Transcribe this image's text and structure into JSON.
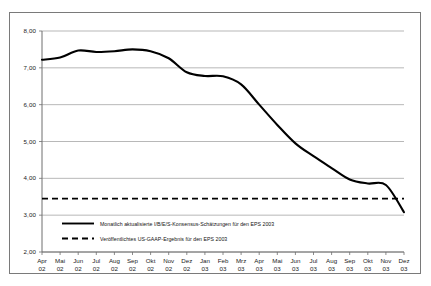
{
  "chart_data": {
    "type": "line",
    "title": "",
    "subtitle": "",
    "xlabel": "",
    "ylabel": "",
    "ylim": [
      2.0,
      8.0
    ],
    "ytick_step": 1.0,
    "grid": true,
    "legend_position": "inside-bottom-left",
    "decimal_separator": "comma",
    "x_tick_labels": [
      {
        "month": "Apr",
        "year": "02"
      },
      {
        "month": "Mai",
        "year": "02"
      },
      {
        "month": "Jun",
        "year": "02"
      },
      {
        "month": "Jul",
        "year": "02"
      },
      {
        "month": "Aug",
        "year": "02"
      },
      {
        "month": "Sep",
        "year": "02"
      },
      {
        "month": "Okt",
        "year": "02"
      },
      {
        "month": "Nov",
        "year": "02"
      },
      {
        "month": "Dez",
        "year": "02"
      },
      {
        "month": "Jan",
        "year": "03"
      },
      {
        "month": "Feb",
        "year": "03"
      },
      {
        "month": "Mrz",
        "year": "03"
      },
      {
        "month": "Apr",
        "year": "03"
      },
      {
        "month": "Mai",
        "year": "03"
      },
      {
        "month": "Jun",
        "year": "03"
      },
      {
        "month": "Jul",
        "year": "03"
      },
      {
        "month": "Aug",
        "year": "03"
      },
      {
        "month": "Sep",
        "year": "03"
      },
      {
        "month": "Okt",
        "year": "03"
      },
      {
        "month": "Nov",
        "year": "03"
      },
      {
        "month": "Dez",
        "year": "03"
      }
    ],
    "y_tick_labels": [
      "8,00",
      "7,00",
      "6,00",
      "5,00",
      "4,00",
      "3,00",
      "2,00"
    ],
    "categories": [
      "Apr 02",
      "Mai 02",
      "Jun 02",
      "Jul 02",
      "Aug 02",
      "Sep 02",
      "Okt 02",
      "Nov 02",
      "Dez 02",
      "Jan 03",
      "Feb 03",
      "Mrz 03",
      "Apr 03",
      "Mai 03",
      "Jun 03",
      "Jul 03",
      "Aug 03",
      "Sep 03",
      "Okt 03",
      "Nov 03",
      "Dez 03"
    ],
    "series": [
      {
        "name": "Monatlich aktualisierte I/B/E/S-Konsensus-Schätzungen für den EPS 2003",
        "style": "solid",
        "color": "#000000",
        "values": [
          7.22,
          7.28,
          7.47,
          7.43,
          7.45,
          7.5,
          7.45,
          7.26,
          6.88,
          6.78,
          6.77,
          6.55,
          6.0,
          5.45,
          4.95,
          4.6,
          4.28,
          3.97,
          3.86,
          3.82,
          3.08
        ]
      },
      {
        "name": "Veröffentlichtes US-GAAP-Ergebnis für den EPS 2003",
        "style": "dashed",
        "color": "#000000",
        "constant_value": 3.45,
        "values": [
          3.45,
          3.45,
          3.45,
          3.45,
          3.45,
          3.45,
          3.45,
          3.45,
          3.45,
          3.45,
          3.45,
          3.45,
          3.45,
          3.45,
          3.45,
          3.45,
          3.45,
          3.45,
          3.45,
          3.45,
          3.45
        ]
      }
    ],
    "legend": [
      {
        "label": "Monatlich aktualisierte I/B/E/S-Konsensus-Schätzungen für den EPS 2003",
        "style": "solid"
      },
      {
        "label": "Veröffentlichtes US-GAAP-Ergebnis für den EPS 2003",
        "style": "dashed"
      }
    ]
  }
}
